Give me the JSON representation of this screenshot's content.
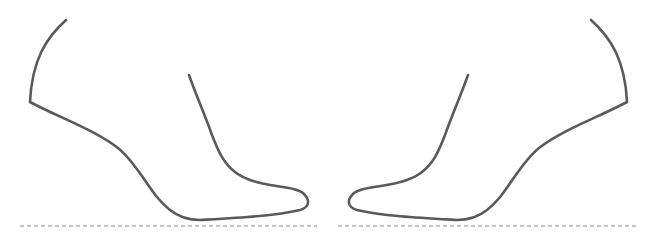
{
  "figure": {
    "colors": {
      "outline": "#5a5a5a",
      "baseline": "#8a8a8a",
      "background": "#ffffff"
    },
    "shoes": [
      {
        "id": "left",
        "facing": "right"
      },
      {
        "id": "right",
        "facing": "left"
      }
    ]
  }
}
